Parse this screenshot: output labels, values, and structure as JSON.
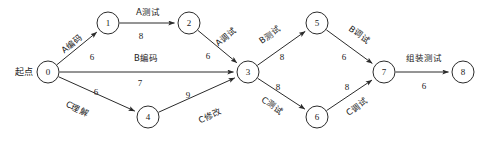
{
  "diagram": {
    "type": "activity-on-edge-network",
    "start_label": "起点",
    "stroke_color": "#2b2b2b",
    "background_color": "#ffffff",
    "node_radius": 11,
    "nodes": [
      {
        "id": "0",
        "label": "0",
        "x": 48,
        "y": 72
      },
      {
        "id": "1",
        "label": "1",
        "x": 108,
        "y": 23
      },
      {
        "id": "2",
        "label": "2",
        "x": 189,
        "y": 23
      },
      {
        "id": "3",
        "label": "3",
        "x": 248,
        "y": 72
      },
      {
        "id": "4",
        "label": "4",
        "x": 148,
        "y": 117
      },
      {
        "id": "5",
        "label": "5",
        "x": 317,
        "y": 23
      },
      {
        "id": "6",
        "label": "6",
        "x": 317,
        "y": 117
      },
      {
        "id": "7",
        "label": "7",
        "x": 384,
        "y": 72
      },
      {
        "id": "8",
        "label": "8",
        "x": 463,
        "y": 72
      }
    ],
    "edges": [
      {
        "from": "0",
        "to": "1",
        "name": "A编码",
        "weight": "6",
        "name_x": 72,
        "name_y": 44,
        "name_rot": -39,
        "weight_x": 92,
        "weight_y": 58
      },
      {
        "from": "1",
        "to": "2",
        "name": "A测试",
        "weight": "8",
        "name_x": 148,
        "name_y": 12,
        "name_rot": 0,
        "weight_x": 141,
        "weight_y": 37
      },
      {
        "from": "2",
        "to": "3",
        "name": "A调试",
        "weight": "6",
        "name_x": 226,
        "name_y": 37,
        "name_rot": -39,
        "weight_x": 208,
        "weight_y": 57
      },
      {
        "from": "0",
        "to": "3",
        "name": "B编码",
        "weight": "7",
        "name_x": 146,
        "name_y": 58,
        "name_rot": 0,
        "weight_x": 140,
        "weight_y": 84
      },
      {
        "from": "0",
        "to": "4",
        "name": "C理解",
        "weight": "6",
        "name_x": 77,
        "name_y": 109,
        "name_rot": 26,
        "weight_x": 96,
        "weight_y": 93
      },
      {
        "from": "4",
        "to": "3",
        "name": "C修改",
        "weight": "9",
        "name_x": 210,
        "name_y": 116,
        "name_rot": -26,
        "weight_x": 188,
        "weight_y": 96
      },
      {
        "from": "3",
        "to": "5",
        "name": "B测试",
        "weight": "8",
        "name_x": 270,
        "name_y": 35,
        "name_rot": -36,
        "weight_x": 282,
        "weight_y": 58
      },
      {
        "from": "5",
        "to": "7",
        "name": "B调试",
        "weight": "6",
        "name_x": 359,
        "name_y": 35,
        "name_rot": 36,
        "weight_x": 344,
        "weight_y": 58
      },
      {
        "from": "3",
        "to": "6",
        "name": "C测试",
        "weight": "8",
        "name_x": 272,
        "name_y": 106,
        "name_rot": 36,
        "weight_x": 278,
        "weight_y": 88
      },
      {
        "from": "6",
        "to": "7",
        "name": "C调试",
        "weight": "8",
        "name_x": 357,
        "name_y": 107,
        "name_rot": -36,
        "weight_x": 347,
        "weight_y": 88
      },
      {
        "from": "7",
        "to": "8",
        "name": "组装测试",
        "weight": "6",
        "name_x": 424,
        "name_y": 58,
        "name_rot": 0,
        "weight_x": 424,
        "weight_y": 87
      }
    ]
  }
}
